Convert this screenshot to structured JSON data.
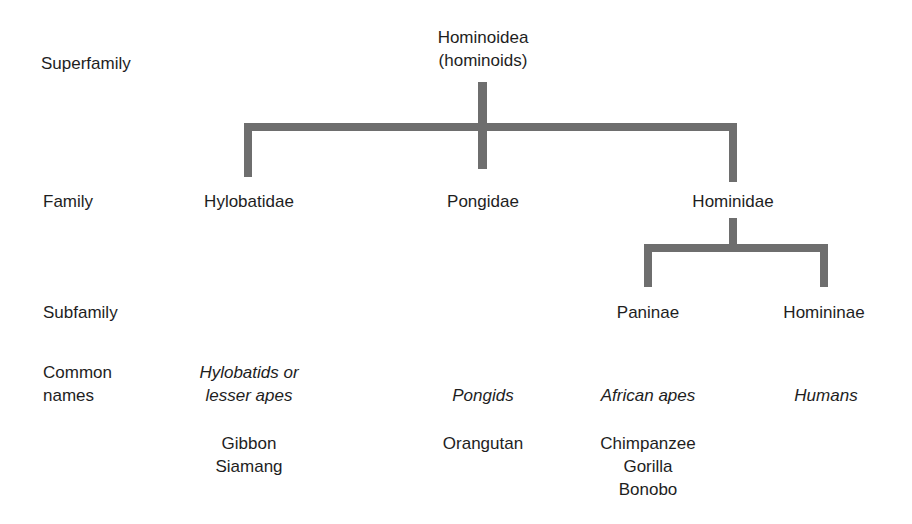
{
  "rank_labels": {
    "superfamily": "Superfamily",
    "family": "Family",
    "subfamily": "Subfamily",
    "common_names_line1": "Common",
    "common_names_line2": "names"
  },
  "superfamily": {
    "name": "Hominoidea",
    "common": "(hominoids)"
  },
  "families": [
    {
      "name": "Hylobatidae",
      "common_line1": "Hylobatids or",
      "common_line2": "lesser apes",
      "species": [
        "Gibbon",
        "Siamang"
      ]
    },
    {
      "name": "Pongidae",
      "common_line1": "Pongids",
      "species": [
        "Orangutan"
      ]
    },
    {
      "name": "Hominidae"
    }
  ],
  "subfamilies": [
    {
      "name": "Paninae",
      "common_line1": "African apes",
      "species": [
        "Chimpanzee",
        "Gorilla",
        "Bonobo"
      ]
    },
    {
      "name": "Homininae",
      "common_line1": "Humans"
    }
  ],
  "colors": {
    "line": "#6e6e6e",
    "text": "#1e1e1e",
    "background": "#ffffff"
  }
}
